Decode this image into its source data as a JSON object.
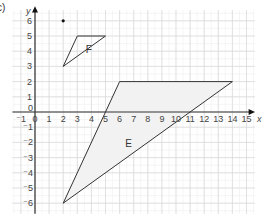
{
  "part_label": "c)",
  "axes": {
    "x_label": "x",
    "y_label": "y",
    "x_ticks": [
      "-1",
      "0",
      "1",
      "2",
      "3",
      "4",
      "5",
      "6",
      "7",
      "8",
      "9",
      "10",
      "11",
      "12",
      "13",
      "14",
      "15"
    ],
    "y_ticks_pos": [
      "1",
      "2",
      "3",
      "4",
      "5",
      "6"
    ],
    "y_ticks_neg": [
      "-1",
      "-2",
      "-3",
      "-4",
      "-5",
      "-6"
    ],
    "xlim": [
      -1,
      15
    ],
    "ylim": [
      -6,
      6
    ]
  },
  "shapes": {
    "F": {
      "label": "F",
      "vertices": [
        [
          2,
          3
        ],
        [
          3,
          5
        ],
        [
          5,
          5
        ]
      ]
    },
    "E": {
      "label": "E",
      "vertices": [
        [
          6,
          2
        ],
        [
          14,
          2
        ],
        [
          2,
          -6
        ]
      ]
    },
    "point": {
      "x": 2,
      "y": 6
    }
  },
  "colors": {
    "grid": "#d9d9d9",
    "axis": "#333333",
    "shape": "#333333",
    "shade": "#f2f2f2"
  }
}
